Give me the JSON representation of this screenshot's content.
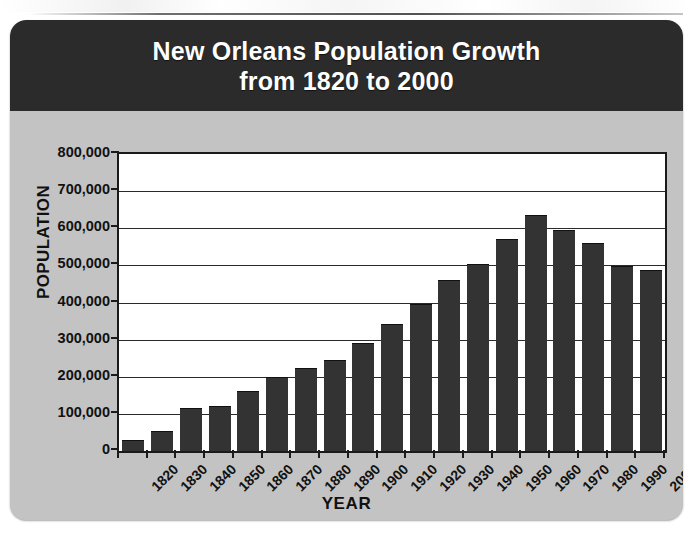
{
  "card": {
    "title_line1": "New Orleans Population Growth",
    "title_line2": "from 1820 to 2000",
    "title_bar_color": "#2b2b2b",
    "background_color": "#c3c3c3",
    "bar_color": "#333333",
    "plot_background": "#ffffff"
  },
  "chart_data": {
    "type": "bar",
    "title": "New Orleans Population Growth from 1820 to 2000",
    "xlabel": "YEAR",
    "ylabel": "POPULATION",
    "ylim": [
      0,
      800000
    ],
    "ytick_values": [
      0,
      100000,
      200000,
      300000,
      400000,
      500000,
      600000,
      700000,
      800000
    ],
    "ytick_labels": [
      "0",
      "100,000",
      "200,000",
      "300,000",
      "400,000",
      "500,000",
      "600,000",
      "700,000",
      "800,000"
    ],
    "grid": true,
    "legend": "none",
    "categories": [
      "1820",
      "1830",
      "1840",
      "1850",
      "1860",
      "1870",
      "1880",
      "1890",
      "1900",
      "1910",
      "1920",
      "1930",
      "1940",
      "1950",
      "1960",
      "1970",
      "1980",
      "1990",
      "2000"
    ],
    "values": [
      27000,
      50000,
      112000,
      119000,
      160000,
      196000,
      222000,
      242000,
      287000,
      339000,
      392000,
      459000,
      501000,
      568000,
      632000,
      593000,
      557000,
      497000,
      485000
    ]
  }
}
